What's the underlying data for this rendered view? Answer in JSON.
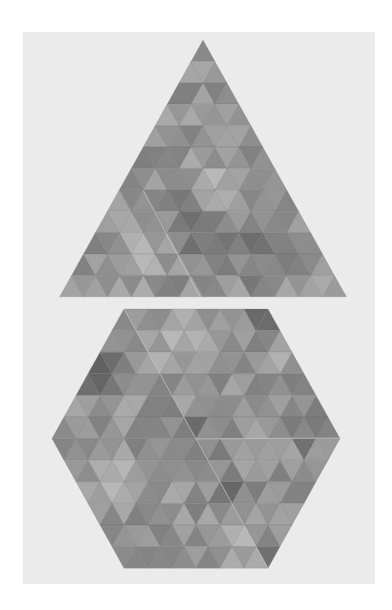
{
  "image": {
    "description": "Photograph of two geometric tile artworks made of small equilateral triangles in shades of gray: a large triangle above a hexagon",
    "background_color": "#ffffff",
    "panel_color": "#ebebeb",
    "tone_range": [
      "#555555",
      "#b8b8b8"
    ]
  },
  "shapes": [
    {
      "name": "triangle",
      "kind": "triangle",
      "apex": [
        203,
        40
      ],
      "rows": 12,
      "row_height": 21.4,
      "tri_width": 23.9,
      "seed": 7,
      "dark_regions": [
        [
          120,
          170,
          40
        ],
        [
          200,
          230,
          50
        ],
        [
          255,
          250,
          45
        ]
      ],
      "light_regions": [
        [
          215,
          190,
          40
        ],
        [
          150,
          255,
          40
        ]
      ],
      "seams": [
        [
          [
            143,
            190
          ],
          [
            200,
            297
          ]
        ]
      ]
    },
    {
      "name": "hexagon",
      "kind": "hexagon",
      "top_left": [
        124,
        309
      ],
      "side_tris": 6,
      "rows": 12,
      "row_height": 21.6,
      "tri_width": 24,
      "seed": 23,
      "dark_regions": [
        [
          95,
          370,
          45
        ],
        [
          265,
          320,
          25
        ],
        [
          195,
          440,
          35
        ],
        [
          310,
          420,
          40
        ],
        [
          275,
          555,
          20
        ],
        [
          230,
          500,
          30
        ]
      ],
      "light_regions": [
        [
          185,
          345,
          45
        ],
        [
          290,
          340,
          30
        ],
        [
          110,
          480,
          40
        ],
        [
          240,
          550,
          40
        ]
      ],
      "seams": [
        [
          [
            196,
            439
          ],
          [
            268,
            568
          ]
        ],
        [
          [
            196,
            439
          ],
          [
            340,
            438
          ]
        ],
        [
          [
            124,
            309
          ],
          [
            196,
            439
          ]
        ]
      ]
    }
  ]
}
